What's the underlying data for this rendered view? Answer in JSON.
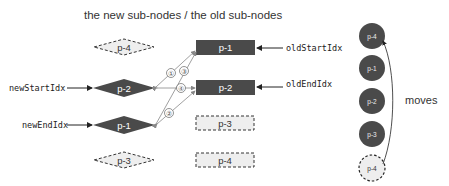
{
  "header": {
    "title": "the new sub-nodes   /  the old sub-nodes"
  },
  "colors": {
    "node_fill": "#4a4a4a",
    "ghost_fill": "#eeeeee",
    "arrow": "#888888",
    "pointer": "#222222"
  },
  "new_nodes": [
    {
      "label": "p-4",
      "style": "ghost"
    },
    {
      "label": "p-2",
      "style": "solid"
    },
    {
      "label": "p-1",
      "style": "solid"
    },
    {
      "label": "p-3",
      "style": "ghost"
    }
  ],
  "old_nodes": [
    {
      "label": "p-1",
      "style": "solid"
    },
    {
      "label": "p-2",
      "style": "solid"
    },
    {
      "label": "p-3",
      "style": "ghost"
    },
    {
      "label": "p-4",
      "style": "ghost"
    }
  ],
  "pointers": {
    "new_start": "newStartIdx",
    "new_end": "newEndIdx",
    "old_start": "oldStartIdx",
    "old_end": "oldEndIdx"
  },
  "comparisons": [
    {
      "label": "①",
      "from": "new p-2",
      "to": "old p-1"
    },
    {
      "label": "②",
      "from": "new p-1",
      "to": "old p-2"
    },
    {
      "label": "③",
      "from": "new p-1",
      "to": "old p-1"
    },
    {
      "label": "④",
      "from": "new p-2",
      "to": "old p-2"
    }
  ],
  "dom_nodes": [
    {
      "label": "p-4",
      "style": "solid"
    },
    {
      "label": "p-1",
      "style": "solid"
    },
    {
      "label": "p-2",
      "style": "solid"
    },
    {
      "label": "p-3",
      "style": "solid"
    },
    {
      "label": "p-4",
      "style": "ghost"
    }
  ],
  "moves_label": "moves"
}
